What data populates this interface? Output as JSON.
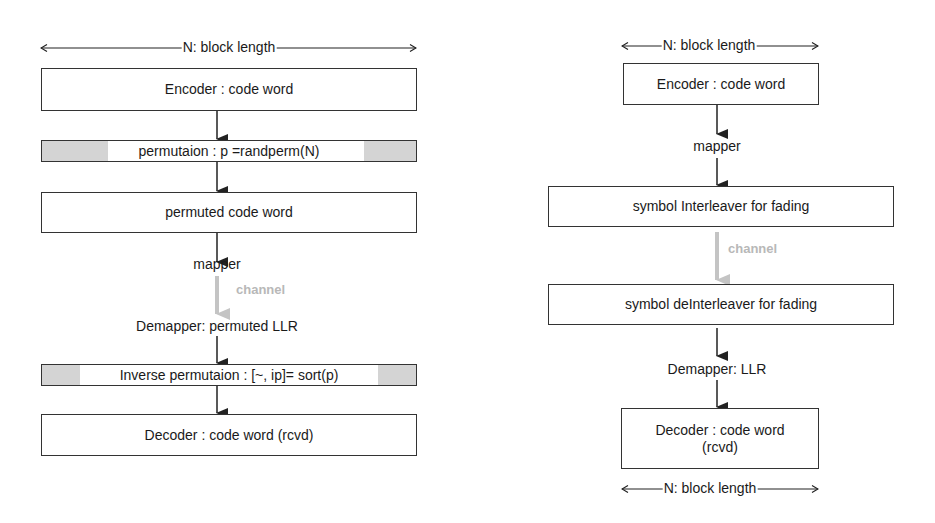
{
  "left_diagram": {
    "dimension_label": "N: block length",
    "encoder": "Encoder : code word",
    "permutation": "permutaion : p =randperm(N)",
    "permuted": "permuted code word",
    "mapper": "mapper",
    "channel": "channel",
    "demapper": "Demapper:  permuted LLR",
    "inverse_permutation": "Inverse  permutaion : [~, ip]= sort(p)",
    "decoder": "Decoder : code word (rcvd)"
  },
  "right_diagram": {
    "top_dimension_label": "N: block length",
    "encoder": "Encoder : code word",
    "mapper": "mapper",
    "interleaver": "symbol Interleaver for fading",
    "channel": "channel",
    "deinterleaver": "symbol deInterleaver for fading",
    "demapper": "Demapper:  LLR",
    "decoder_line1": "Decoder : code word",
    "decoder_line2": "(rcvd)",
    "bottom_dimension_label": "N: block length"
  },
  "colors": {
    "stroke": "#333333",
    "shade": "#d4d4d4",
    "channel_gray": "#b8b8b8"
  }
}
